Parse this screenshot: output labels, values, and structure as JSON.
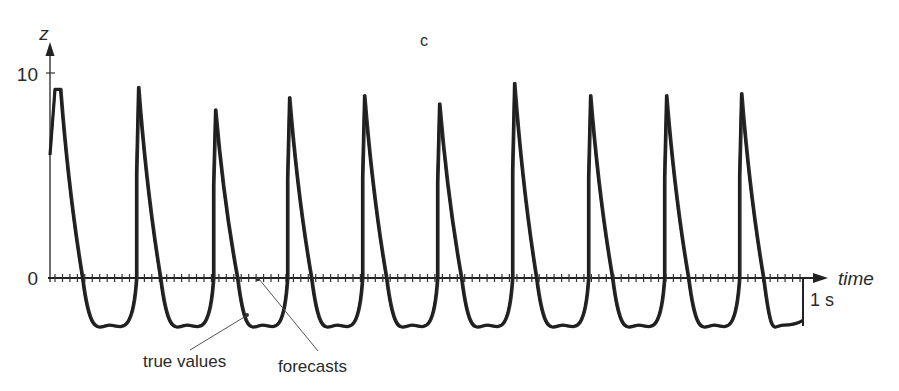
{
  "chart_data": {
    "type": "line",
    "title": "c",
    "xlabel": "time",
    "ylabel": "z",
    "yticks": [
      0,
      10
    ],
    "ytick_labels": [
      "0",
      "10"
    ],
    "ylim": [
      -2.5,
      11
    ],
    "scale_bar": {
      "label": "1 s"
    },
    "grid": false,
    "legend": "annotations",
    "annotations": [
      {
        "text": "true values",
        "points_to": "trough of third cycle"
      },
      {
        "text": "forecasts",
        "points_to": "time axis near third trough"
      }
    ],
    "series": [
      {
        "name": "true values",
        "description": "periodic relaxation oscillation, ~10 cycles, peaks 8–9.5, troughs ~-2.3",
        "peaks": [
          {
            "cycle": 1,
            "z": 9.2
          },
          {
            "cycle": 2,
            "z": 9.3
          },
          {
            "cycle": 3,
            "z": 8.2
          },
          {
            "cycle": 4,
            "z": 8.8
          },
          {
            "cycle": 5,
            "z": 8.9
          },
          {
            "cycle": 6,
            "z": 8.5
          },
          {
            "cycle": 7,
            "z": 9.5
          },
          {
            "cycle": 8,
            "z": 8.9
          },
          {
            "cycle": 9,
            "z": 8.9
          },
          {
            "cycle": 10,
            "z": 9.0
          }
        ],
        "trough_z": -2.3
      },
      {
        "name": "forecasts",
        "description": "overlaps true values closely after initial transient"
      }
    ]
  },
  "labels": {
    "panel": "c",
    "y_axis": "z",
    "x_axis": "time",
    "y_tick_10": "10",
    "y_tick_0": "0",
    "scale": "1 s",
    "true_values": "true values",
    "forecasts": "forecasts"
  }
}
